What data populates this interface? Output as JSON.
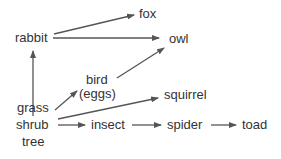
{
  "diagram": {
    "title": "",
    "type": "food web",
    "colors": {
      "text": "#333333",
      "arrow": "#555555",
      "background": "#ffffff"
    },
    "nodes": [
      {
        "id": "rabbit",
        "label": "rabbit"
      },
      {
        "id": "fox",
        "label": "fox"
      },
      {
        "id": "owl",
        "label": "owl"
      },
      {
        "id": "bird",
        "label": "bird"
      },
      {
        "id": "eggs",
        "label": "(eggs)"
      },
      {
        "id": "squirrel",
        "label": "squirrel"
      },
      {
        "id": "grass",
        "label": "grass"
      },
      {
        "id": "shrub",
        "label": "shrub"
      },
      {
        "id": "tree",
        "label": "tree"
      },
      {
        "id": "insect",
        "label": "insect"
      },
      {
        "id": "spider",
        "label": "spider"
      },
      {
        "id": "toad",
        "label": "toad"
      }
    ],
    "edges": [
      {
        "from": "rabbit",
        "to": "fox"
      },
      {
        "from": "rabbit",
        "to": "owl"
      },
      {
        "from": "bird",
        "to": "owl"
      },
      {
        "from": "grass/shrub/tree",
        "to": "rabbit"
      },
      {
        "from": "grass/shrub/tree",
        "to": "bird"
      },
      {
        "from": "grass/shrub/tree",
        "to": "squirrel"
      },
      {
        "from": "grass/shrub/tree",
        "to": "insect"
      },
      {
        "from": "insect",
        "to": "spider"
      },
      {
        "from": "spider",
        "to": "toad"
      }
    ]
  }
}
